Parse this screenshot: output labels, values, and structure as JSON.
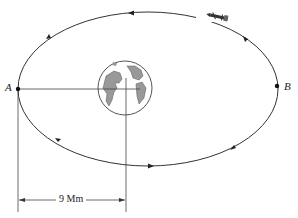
{
  "figure": {
    "points": [
      {
        "id": "A",
        "label": "A"
      },
      {
        "id": "B",
        "label": "B"
      }
    ],
    "dimension": {
      "label": "9 Mm"
    },
    "objects": [
      "orbit-ellipse",
      "earth",
      "spacecraft"
    ]
  }
}
